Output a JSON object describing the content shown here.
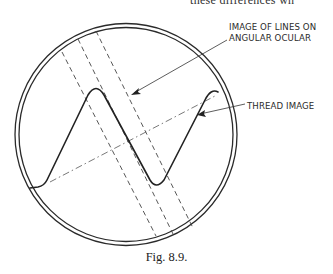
{
  "page": {
    "top_cut_text": "these differences wh"
  },
  "figure": {
    "caption": "Fig. 8.9.",
    "labels": {
      "lines_line1": "IMAGE OF LINES ON",
      "lines_line2": "ANGULAR OCULAR",
      "thread": "THREAD IMAGE"
    },
    "elements": [
      {
        "name": "field-of-view-circle",
        "type": "double-circle"
      },
      {
        "name": "angular-ocular-lines",
        "type": "dashed-parallel-lines",
        "count": 3
      },
      {
        "name": "thread-image",
        "type": "thread-profile-curve"
      },
      {
        "name": "thread-axis",
        "type": "dash-dot-line"
      }
    ],
    "colors": {
      "ink": "#2a2a2a",
      "background": "#ffffff"
    }
  }
}
